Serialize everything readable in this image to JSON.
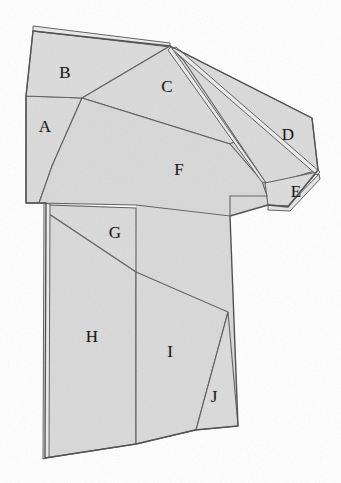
{
  "figure": {
    "colors": {
      "fill": "#d9d9d9",
      "fill_light": "#dedede",
      "stroke": "#565656",
      "stroke_soft": "#767676",
      "label": "#1a1a1a",
      "background": "#ffffff"
    },
    "labels": [
      {
        "id": "A",
        "text": "A",
        "x": 45,
        "y": 126
      },
      {
        "id": "B",
        "text": "B",
        "x": 65,
        "y": 72
      },
      {
        "id": "C",
        "text": "C",
        "x": 167,
        "y": 86
      },
      {
        "id": "D",
        "text": "D",
        "x": 288,
        "y": 134
      },
      {
        "id": "E",
        "text": "E",
        "x": 296,
        "y": 191
      },
      {
        "id": "F",
        "text": "F",
        "x": 179,
        "y": 169
      },
      {
        "id": "G",
        "text": "G",
        "x": 115,
        "y": 232
      },
      {
        "id": "H",
        "text": "H",
        "x": 92,
        "y": 336
      },
      {
        "id": "I",
        "text": "I",
        "x": 170,
        "y": 351
      },
      {
        "id": "J",
        "text": "J",
        "x": 214,
        "y": 396
      }
    ],
    "regions": [
      {
        "id": "A",
        "name": "panel-a",
        "points": "26,96 82,98 52,166 39,203 26,203"
      },
      {
        "id": "B",
        "name": "panel-b",
        "points": "33,31 170,46 82,98 26,96"
      },
      {
        "id": "C",
        "name": "panel-c",
        "points": "170,46 82,98 230,144 250,132"
      },
      {
        "id": "D",
        "name": "panel-d",
        "points": "176,48 312,118 318,170 283,180 266,183"
      },
      {
        "id": "E",
        "name": "panel-e",
        "points": "266,183 318,172 287,207 268,205"
      },
      {
        "id": "F",
        "name": "panel-f",
        "points": "82,98 52,166 39,203 136,205 230,216 230,196 268,196 262,182 230,144"
      },
      {
        "id": "G",
        "name": "panel-g",
        "points": "46,203 136,208 136,272 46,212"
      },
      {
        "id": "H",
        "name": "panel-h",
        "points": "46,212 136,272 136,444 45,458"
      },
      {
        "id": "I",
        "name": "panel-i",
        "points": "136,272 228,312 195,430 136,444"
      },
      {
        "id": "J",
        "name": "panel-j",
        "points": "228,312 238,426 195,430"
      }
    ],
    "outline": {
      "body_points": "33,31 170,46 312,118 318,170 287,207 268,205 230,216 230,196 238,426 195,430 136,444 45,458 46,203 39,203 26,203 26,96",
      "top_fold": "33,28 170,43",
      "sleeve_fold": "173,49 316,173"
    }
  }
}
